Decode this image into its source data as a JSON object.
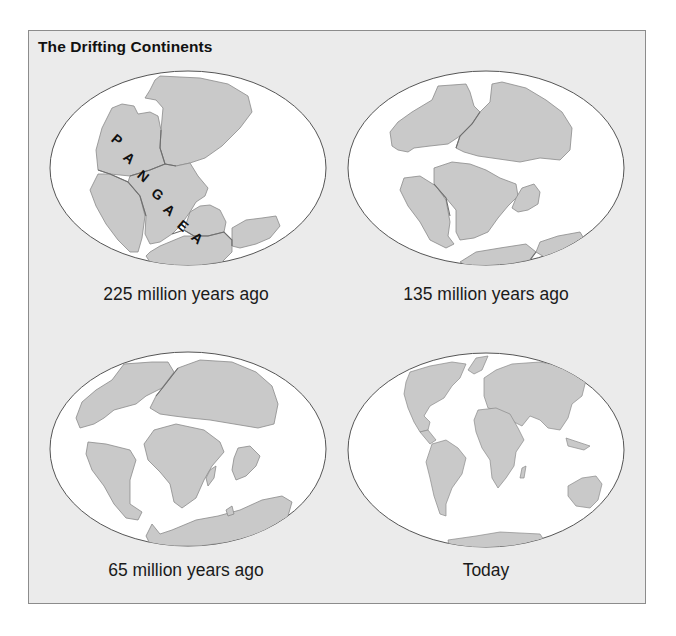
{
  "figure": {
    "title": "The Drifting Continents",
    "colors": {
      "frame_bg": "#ebebeb",
      "frame_border": "#8c8c8c",
      "ocean": "#ffffff",
      "land": "#c9c9c9",
      "land_border": "#8a8a8a",
      "plate_boundary": "#6e6e6e"
    },
    "panels": [
      {
        "id": "225mya",
        "caption": "225 million years ago",
        "supercontinent_label": "PANGAEA",
        "label_letters": [
          "P",
          "A",
          "N",
          "G",
          "A",
          "E",
          "A"
        ]
      },
      {
        "id": "135mya",
        "caption": "135 million years ago"
      },
      {
        "id": "65mya",
        "caption": "65 million years ago"
      },
      {
        "id": "today",
        "caption": "Today"
      }
    ]
  }
}
